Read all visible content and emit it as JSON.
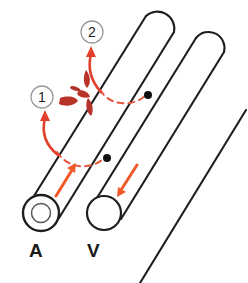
{
  "figure": {
    "type": "medical-diagram",
    "background_color": "#ffffff"
  },
  "vessels": [
    {
      "id": "artery",
      "label": "A",
      "label_x": 29,
      "label_y": 240,
      "wall": "thick",
      "cross_section": "double-circle",
      "outline_color": "#1e1e1e",
      "flow_direction": "up-right",
      "flow_arrow_color": "#f05a28"
    },
    {
      "id": "vein",
      "label": "V",
      "label_x": 87,
      "label_y": 240,
      "wall": "thin",
      "cross_section": "single-circle",
      "outline_color": "#1e1e1e",
      "flow_direction": "down-left",
      "flow_arrow_color": "#f05a28"
    },
    {
      "id": "third-tube",
      "label": "",
      "wall": "thin",
      "cross_section": "none",
      "outline_color": "#1e1e1e",
      "flow_direction": "",
      "flow_arrow_color": ""
    }
  ],
  "callouts": [
    {
      "id": "callout-1",
      "number": "1",
      "cx": 42,
      "cy": 97,
      "r": 11,
      "ring_color": "#9a9a9a",
      "text_color": "#1a1a1a"
    },
    {
      "id": "callout-2",
      "number": "2",
      "cx": 92,
      "cy": 32,
      "r": 11,
      "ring_color": "#9a9a9a",
      "text_color": "#1a1a1a"
    }
  ],
  "puncture_points": [
    {
      "id": "puncture-lower",
      "cx": 107,
      "cy": 158,
      "r": 4,
      "color": "#111111"
    },
    {
      "id": "puncture-upper",
      "cx": 148,
      "cy": 95,
      "r": 4,
      "color": "#111111"
    }
  ],
  "dashed_arcs": [
    {
      "id": "dashed-arc-lower",
      "color": "#e8573f",
      "dash": "6 5",
      "width": 2
    },
    {
      "id": "dashed-arc-upper",
      "color": "#e8573f",
      "dash": "6 5",
      "width": 2
    }
  ],
  "curved_arrows": [
    {
      "id": "curved-arrow-1",
      "target_callout": "1",
      "color": "#e0402c"
    },
    {
      "id": "curved-arrow-2",
      "target_callout": "2",
      "color": "#e0402c"
    }
  ],
  "blood_spurt": {
    "id": "blood-spurt",
    "color": "#b8332a",
    "droplet_count": 5
  },
  "colors": {
    "outline": "#1e1e1e",
    "flow_arrow": "#f05a28",
    "dashed_arc": "#e8573f",
    "curved_arrow": "#e0402c",
    "blood": "#b8332a",
    "callout_ring": "#9a9a9a",
    "label_text": "#1a1a1a",
    "dot": "#111111"
  }
}
